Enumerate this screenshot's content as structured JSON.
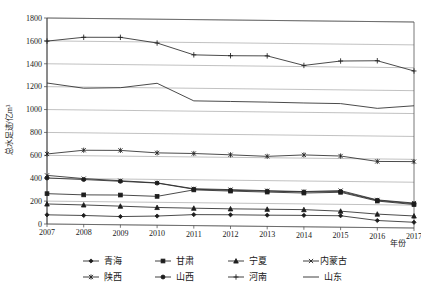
{
  "chart_data": {
    "type": "line",
    "title": "",
    "xlabel": "年份",
    "ylabel": "总水足迹/亿m³",
    "categories": [
      "2007",
      "2008",
      "2009",
      "2010",
      "2011",
      "2012",
      "2013",
      "2014",
      "2015",
      "2016",
      "2017"
    ],
    "ylim": [
      0,
      1800
    ],
    "ytick_step": 200,
    "yticks": [
      "0",
      "200",
      "400",
      "600",
      "800",
      "1000",
      "1200",
      "1400",
      "1600",
      "1800"
    ],
    "grid": true,
    "legend_position": "bottom",
    "series": [
      {
        "name": "青海",
        "marker": "diamond",
        "values": [
          80,
          78,
          72,
          80,
          96,
          98,
          98,
          100,
          100,
          62,
          50
        ]
      },
      {
        "name": "甘肃",
        "marker": "square",
        "values": [
          265,
          258,
          260,
          252,
          312,
          305,
          300,
          295,
          305,
          232,
          205
        ]
      },
      {
        "name": "宁夏",
        "marker": "triangle",
        "values": [
          175,
          170,
          163,
          155,
          152,
          150,
          150,
          150,
          140,
          118,
          105
        ]
      },
      {
        "name": "内蒙古",
        "marker": "cross-x",
        "values": [
          425,
          400,
          385,
          370,
          322,
          318,
          312,
          308,
          320,
          242,
          218
        ]
      },
      {
        "name": "陕西",
        "marker": "asterisk",
        "values": [
          612,
          648,
          650,
          632,
          630,
          622,
          612,
          628,
          622,
          578,
          580
        ]
      },
      {
        "name": "山西",
        "marker": "circle",
        "values": [
          402,
          392,
          380,
          368,
          318,
          312,
          308,
          305,
          312,
          238,
          212
        ]
      },
      {
        "name": "河南",
        "marker": "plus",
        "values": [
          1598,
          1635,
          1638,
          1592,
          1492,
          1488,
          1490,
          1410,
          1452,
          1458,
          1372
        ]
      },
      {
        "name": "山东",
        "marker": "none",
        "values": [
          1232,
          1190,
          1198,
          1240,
          1090,
          1088,
          1086,
          1082,
          1080,
          1042,
          1068
        ]
      }
    ]
  },
  "legend": {
    "row1": [
      "青海",
      "甘肃",
      "宁夏",
      "内蒙古"
    ],
    "row2": [
      "陕西",
      "山西",
      "河南",
      "山东"
    ]
  },
  "axis": {
    "y_title": "总水足迹/亿m³",
    "x_title": "年份"
  }
}
